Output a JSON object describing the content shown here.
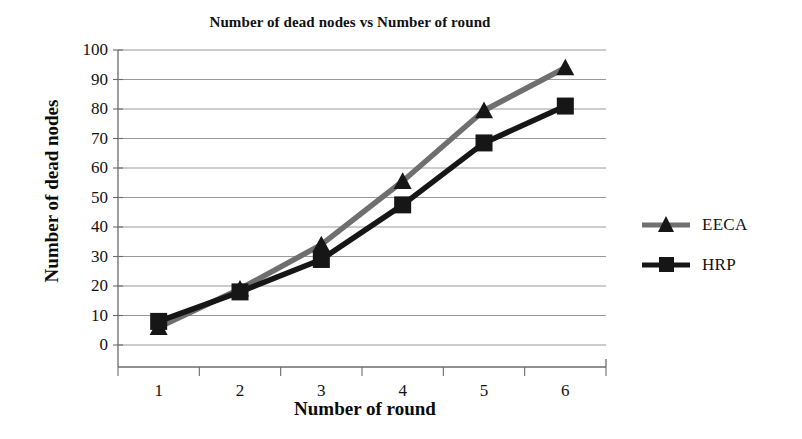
{
  "chart_data": {
    "type": "line",
    "title": "Number of dead nodes vs Number of round",
    "xlabel": "Number of round",
    "ylabel": "Number of dead nodes",
    "categories": [
      "1",
      "2",
      "3",
      "4",
      "5",
      "6"
    ],
    "xticks": [
      "1",
      "2",
      "3",
      "4",
      "5",
      "6"
    ],
    "yticks": [
      "0",
      "10",
      "20",
      "30",
      "40",
      "50",
      "60",
      "70",
      "80",
      "90",
      "100"
    ],
    "ylim": [
      0,
      100
    ],
    "ytick_step": 10,
    "grid": "horizontal",
    "legend_position": "right",
    "series": [
      {
        "name": "EECA",
        "marker": "triangle",
        "color": "#6f6f6f",
        "values": [
          6,
          19,
          34,
          55.5,
          79.5,
          94
        ]
      },
      {
        "name": "HRP",
        "marker": "square",
        "color": "#161616",
        "values": [
          8,
          18,
          29,
          47.5,
          68.5,
          81
        ]
      }
    ]
  },
  "legend": {
    "items": [
      {
        "label": "EECA"
      },
      {
        "label": "HRP"
      }
    ]
  },
  "colors": {
    "eeca": "#6f6f6f",
    "hrp": "#161616",
    "grid": "#9a9a9a",
    "axis": "#6b6b6b",
    "text": "#111111"
  }
}
